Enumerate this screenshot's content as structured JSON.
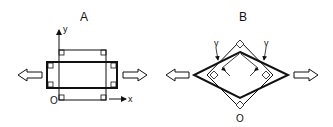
{
  "panels": [
    {
      "label": "A",
      "axis_y": "y",
      "axis_x": "x",
      "origin": "O"
    },
    {
      "label": "B",
      "angle_left": "γ",
      "angle_right": "γ",
      "origin": "O"
    }
  ],
  "colors": {
    "stroke": "#111111",
    "background": "#ffffff"
  }
}
